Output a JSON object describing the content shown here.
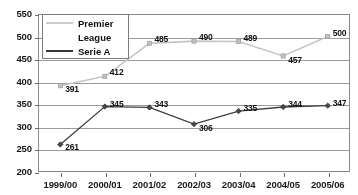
{
  "chart_data": {
    "type": "line",
    "title": "",
    "xlabel": "",
    "ylabel": "",
    "categories": [
      "1999/00",
      "2000/01",
      "2001/02",
      "2002/03",
      "2003/04",
      "2004/05",
      "2005/06"
    ],
    "ylim": [
      200,
      550
    ],
    "yticks": [
      200,
      250,
      300,
      350,
      400,
      450,
      500,
      550
    ],
    "ytick_labels": [
      "200",
      "250",
      "300",
      "350",
      "400",
      "450",
      "500",
      "550"
    ],
    "grid": true,
    "legend_position": "top-left-inside",
    "series": [
      {
        "name": "Premier League",
        "color": "#c2c2c2",
        "marker": "square",
        "values": [
          391,
          412,
          485,
          490,
          489,
          457,
          500
        ],
        "labels": [
          "391",
          "412",
          "485",
          "490",
          "489",
          "457",
          "500"
        ]
      },
      {
        "name": "Serie A",
        "color": "#3d3d3d",
        "marker": "diamond",
        "values": [
          261,
          345,
          343,
          306,
          335,
          344,
          347
        ],
        "labels": [
          "261",
          "345",
          "343",
          "306",
          "335",
          "344",
          "347"
        ]
      }
    ]
  },
  "legend": {
    "entries": [
      {
        "line1": "Premier",
        "line2": "League"
      },
      {
        "line1": "Serie A",
        "line2": ""
      }
    ]
  },
  "colors": {
    "premier_league": "#c2c2c2",
    "serie_a": "#3d3d3d",
    "grid": "#9a9a9a",
    "axis": "#8a8a8a",
    "text": "#111111",
    "background": "#ffffff"
  }
}
